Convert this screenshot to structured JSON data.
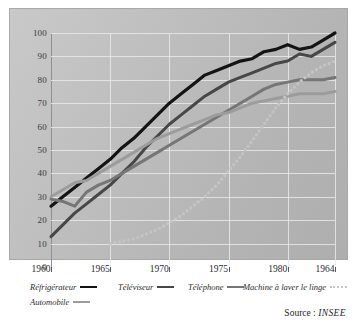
{
  "figure": {
    "top_fragment": "",
    "source_prefix": "Source :",
    "source_name": "INSEE"
  },
  "legend": {
    "items": [
      {
        "label": "Réfrigérateur",
        "color": "#141414",
        "style": "solid"
      },
      {
        "label": "Téléviseur",
        "color": "#474747",
        "style": "solid"
      },
      {
        "label": "Téléphone",
        "color": "#767676",
        "style": "solid"
      },
      {
        "label": "Machine à laver le linge",
        "color": "#c4c4c4",
        "style": "dotted"
      },
      {
        "label": "Automobile",
        "color": "#9c9c9c",
        "style": "solid"
      }
    ]
  },
  "chart_data": {
    "type": "line",
    "title": "",
    "xlabel": "",
    "ylabel": "",
    "xlim": [
      1960,
      1984
    ],
    "ylim": [
      0,
      100
    ],
    "grid": true,
    "legend_position": "bottom",
    "xticks": [
      1960,
      1965,
      1970,
      1975,
      1980,
      1984
    ],
    "xticklabels": [
      "1960",
      "1965",
      "1970",
      "1975",
      "1980",
      "1964"
    ],
    "yticks": [
      0,
      10,
      20,
      30,
      40,
      50,
      60,
      70,
      80,
      90,
      100
    ],
    "yticklabels": [
      "0",
      "10",
      "20",
      "30",
      "40",
      "50",
      "60",
      "70",
      "80",
      "90",
      "100"
    ],
    "series": [
      {
        "name": "Réfrigérateur",
        "color": "#141414",
        "style": "solid",
        "width": 3.2,
        "x": [
          1960,
          1961,
          1962,
          1963,
          1964,
          1965,
          1966,
          1967,
          1968,
          1969,
          1970,
          1971,
          1972,
          1973,
          1974,
          1975,
          1976,
          1977,
          1978,
          1979,
          1980,
          1981,
          1982,
          1983,
          1984
        ],
        "y": [
          26,
          30,
          34,
          38,
          42,
          46,
          51,
          55,
          60,
          65,
          70,
          74,
          78,
          82,
          84,
          86,
          88,
          89,
          92,
          93,
          95,
          93,
          94,
          97,
          100
        ]
      },
      {
        "name": "Téléviseur",
        "color": "#474747",
        "style": "solid",
        "width": 3.0,
        "x": [
          1960,
          1961,
          1962,
          1963,
          1964,
          1965,
          1966,
          1967,
          1968,
          1969,
          1970,
          1971,
          1972,
          1973,
          1974,
          1975,
          1976,
          1977,
          1978,
          1979,
          1980,
          1981,
          1982,
          1983,
          1984
        ],
        "y": [
          13,
          18,
          23,
          27,
          31,
          35,
          40,
          45,
          51,
          56,
          61,
          65,
          69,
          73,
          76,
          79,
          81,
          83,
          85,
          87,
          88,
          91,
          90,
          93,
          96
        ]
      },
      {
        "name": "Téléphone",
        "color": "#767676",
        "style": "solid",
        "width": 3.0,
        "x": [
          1960,
          1961,
          1962,
          1963,
          1964,
          1965,
          1966,
          1967,
          1968,
          1969,
          1970,
          1971,
          1972,
          1973,
          1974,
          1975,
          1976,
          1977,
          1978,
          1979,
          1980,
          1981,
          1982,
          1983,
          1984
        ],
        "y": [
          29,
          28,
          26,
          32,
          35,
          37,
          40,
          43,
          46,
          49,
          52,
          55,
          58,
          61,
          64,
          67,
          70,
          73,
          76,
          78,
          79,
          80,
          80,
          80,
          81
        ]
      },
      {
        "name": "Automobile",
        "color": "#9c9c9c",
        "style": "solid",
        "width": 3.0,
        "x": [
          1960,
          1961,
          1962,
          1963,
          1964,
          1965,
          1966,
          1967,
          1968,
          1969,
          1970,
          1971,
          1972,
          1973,
          1974,
          1975,
          1976,
          1977,
          1978,
          1979,
          1980,
          1981,
          1982,
          1983,
          1984
        ],
        "y": [
          30,
          33,
          36,
          37,
          40,
          43,
          46,
          49,
          52,
          55,
          57,
          59,
          61,
          63,
          65,
          66,
          68,
          70,
          71,
          72,
          73,
          74,
          74,
          74,
          75
        ]
      },
      {
        "name": "Machine à laver le linge",
        "color": "#c4c4c4",
        "style": "dotted",
        "width": 3.2,
        "x": [
          1965,
          1966,
          1967,
          1968,
          1969,
          1970,
          1971,
          1972,
          1973,
          1974,
          1975,
          1976,
          1977,
          1978,
          1979,
          1980,
          1981,
          1982,
          1983,
          1984
        ],
        "y": [
          10,
          11,
          12,
          14,
          16,
          19,
          22,
          26,
          30,
          35,
          41,
          47,
          54,
          61,
          68,
          74,
          79,
          83,
          86,
          88
        ]
      }
    ]
  }
}
